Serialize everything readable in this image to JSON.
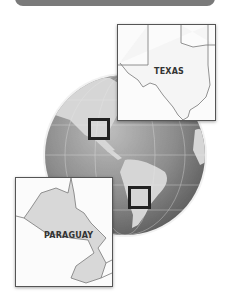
{
  "banner": {
    "color": "#7a7a7a"
  },
  "globe": {
    "center": [
      125,
      155
    ],
    "radius": 80,
    "ocean_color": "#8a8a8a",
    "land_color": "#d4d4d4"
  },
  "insets": [
    {
      "id": "texas",
      "label": "TEXAS",
      "box": [
        117,
        24,
        99,
        97
      ],
      "locator": [
        88,
        118,
        22,
        22
      ]
    },
    {
      "id": "paraguay",
      "label": "PARAGUAY",
      "box": [
        15,
        177,
        98,
        110
      ],
      "locator": [
        128,
        186,
        23,
        23
      ]
    }
  ]
}
